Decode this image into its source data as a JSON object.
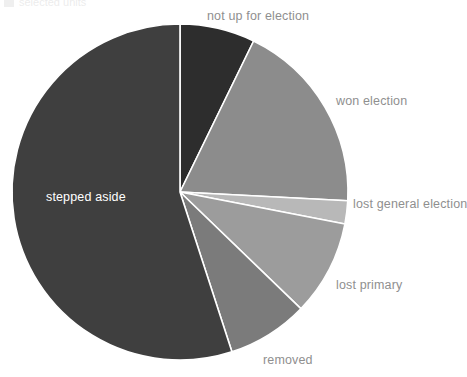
{
  "legend_stub": {
    "label": "selected units",
    "swatch_color": "#6b6b6b"
  },
  "chart_data": {
    "type": "pie",
    "title": "",
    "subtitle": "",
    "xlabel": "",
    "ylabel": "",
    "legend_position": "top-left-cropped",
    "grid": false,
    "start_angle_deg": 0,
    "direction": "clockwise",
    "center": {
      "x": 180,
      "y": 192
    },
    "radius": 168,
    "slice_gap_color": "#ffffff",
    "categories": [
      "not up for election",
      "won election",
      "lost general election",
      "lost primary",
      "removed",
      "stepped aside"
    ],
    "values": [
      7.2,
      18.6,
      2.2,
      9.2,
      7.8,
      55.0
    ],
    "slices": [
      {
        "label": "not up for election",
        "value": 7.2,
        "angle_deg": 26,
        "color": "#2d2d2d",
        "label_color": "#8f8f8f",
        "label_placement": "outside"
      },
      {
        "label": "won election",
        "value": 18.6,
        "angle_deg": 67,
        "color": "#8c8c8c",
        "label_color": "#8f8f8f",
        "label_placement": "outside"
      },
      {
        "label": "lost general election",
        "value": 2.2,
        "angle_deg": 8,
        "color": "#b8b8b8",
        "label_color": "#8f8f8f",
        "label_placement": "outside"
      },
      {
        "label": "lost primary",
        "value": 9.2,
        "angle_deg": 33,
        "color": "#9c9c9c",
        "label_color": "#8f8f8f",
        "label_placement": "outside"
      },
      {
        "label": "removed",
        "value": 7.8,
        "angle_deg": 28,
        "color": "#7b7b7b",
        "label_color": "#8f8f8f",
        "label_placement": "outside"
      },
      {
        "label": "stepped aside",
        "value": 55.0,
        "angle_deg": 198,
        "color": "#3f3f3f",
        "label_color": "#ffffff",
        "label_placement": "inside"
      }
    ],
    "colors": [
      "#2d2d2d",
      "#8c8c8c",
      "#b8b8b8",
      "#9c9c9c",
      "#7b7b7b",
      "#3f3f3f"
    ]
  }
}
